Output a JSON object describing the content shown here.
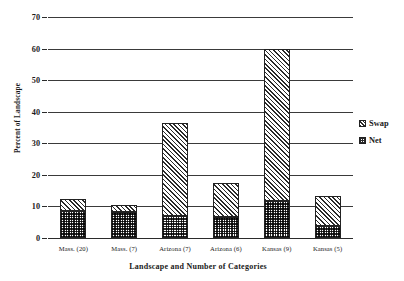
{
  "chart_data": {
    "type": "bar",
    "title": "",
    "subtitle": "",
    "xlabel": "Landscape and Number of Categories",
    "ylabel": "Percent of Landscape",
    "categories": [
      "Mass. (20)",
      "Mass. (7)",
      "Arizona (7)",
      "Arizona (6)",
      "Kansas (9)",
      "Kansas (5)"
    ],
    "stacked": true,
    "series": [
      {
        "name": "Net",
        "values": [
          8.5,
          8.2,
          6.9,
          6.8,
          11.8,
          3.8
        ]
      },
      {
        "name": "Swap",
        "values": [
          3.8,
          2.4,
          29.6,
          10.5,
          48.2,
          9.4
        ]
      }
    ],
    "totals": [
      12.3,
      10.6,
      36.5,
      17.3,
      60.0,
      13.2
    ],
    "ylim": [
      0,
      70
    ],
    "yticks": [
      0,
      10,
      20,
      30,
      40,
      50,
      60,
      70
    ],
    "ytick_labels": [
      "0",
      "10",
      "20",
      "30",
      "40",
      "50",
      "60",
      "70"
    ],
    "grid": true,
    "grid_axis": "y",
    "legend_position": "right",
    "legend": [
      {
        "label": "Swap",
        "pattern": "diagonal-hatch"
      },
      {
        "label": "Net",
        "pattern": "checkerboard"
      }
    ],
    "colors": {
      "ink": "#222222",
      "background": "#ffffff"
    }
  }
}
